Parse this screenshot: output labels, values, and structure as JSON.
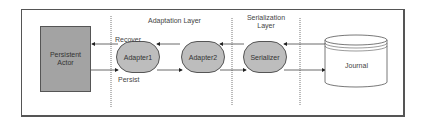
{
  "diagram": {
    "layers": {
      "adaptation": "Adaptation Layer",
      "serialization_line1": "Serialization",
      "serialization_line2": "Layer"
    },
    "nodes": {
      "actor_line1": "Persistent",
      "actor_line2": "Actor",
      "adapter1": "Adapter1",
      "adapter2": "Adapter2",
      "serializer": "Serializer",
      "journal": "Journal"
    },
    "edges": {
      "recover": "Recover",
      "persist": "Persist"
    },
    "colors": {
      "actor_fill": "#a3a3a3",
      "node_fill": "#bdbdbd",
      "stroke": "#555555"
    }
  }
}
